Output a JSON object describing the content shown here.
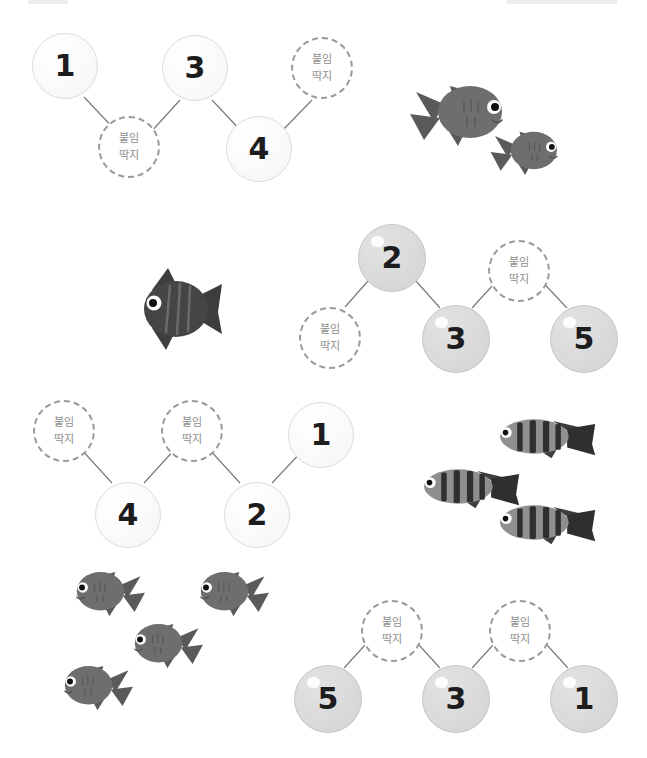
{
  "page": {
    "background": "#ffffff",
    "sticker_label_line1": "붙임",
    "sticker_label_line2": "딱지",
    "colors": {
      "bubble_light_fill": "#fbfbfb",
      "bubble_light_border": "#dcdcdc",
      "bubble_grey_fill": "#dcdcdc",
      "bubble_grey_border": "#c6c6c6",
      "sticker_border": "#9a9a9a",
      "sticker_text": "#8d8d8d",
      "number_text": "#1d1d1d",
      "connector_line": "#7a7a7a",
      "fish_body": "#6e6e6e",
      "fish_fin": "#4f4f4f",
      "fish_dark": "#3d3d3d",
      "fish_stripe": "#8f8f8f",
      "edge_mark": "#dedede"
    }
  },
  "rows": [
    {
      "id": "row-1",
      "bubble_style": "light",
      "nodes": [
        {
          "kind": "number",
          "value": "1"
        },
        {
          "kind": "sticker"
        },
        {
          "kind": "number",
          "value": "3"
        },
        {
          "kind": "number",
          "value": "4"
        },
        {
          "kind": "sticker"
        }
      ],
      "fish": {
        "species": "goldfish",
        "count": 2,
        "facing": "right"
      }
    },
    {
      "id": "row-2",
      "bubble_style": "grey",
      "nodes": [
        {
          "kind": "sticker"
        },
        {
          "kind": "number",
          "value": "2"
        },
        {
          "kind": "number",
          "value": "3"
        },
        {
          "kind": "sticker"
        },
        {
          "kind": "number",
          "value": "5"
        }
      ],
      "fish": {
        "species": "angelfish",
        "count": 1,
        "facing": "left"
      }
    },
    {
      "id": "row-3",
      "bubble_style": "light",
      "nodes": [
        {
          "kind": "sticker"
        },
        {
          "kind": "number",
          "value": "4"
        },
        {
          "kind": "sticker"
        },
        {
          "kind": "number",
          "value": "2"
        },
        {
          "kind": "number",
          "value": "1"
        }
      ],
      "fish": {
        "species": "striped-fish",
        "count": 3,
        "facing": "left"
      }
    },
    {
      "id": "row-4",
      "bubble_style": "grey",
      "nodes": [
        {
          "kind": "number",
          "value": "5"
        },
        {
          "kind": "sticker"
        },
        {
          "kind": "number",
          "value": "3"
        },
        {
          "kind": "sticker"
        },
        {
          "kind": "number",
          "value": "1"
        }
      ],
      "fish": {
        "species": "goldfish",
        "count": 4,
        "facing": "left"
      }
    }
  ]
}
